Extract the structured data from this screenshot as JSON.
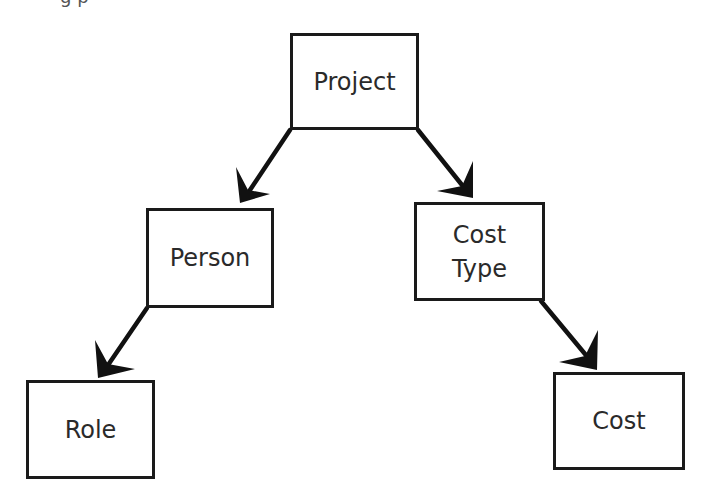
{
  "diagram": {
    "type": "hierarchy",
    "nodes": [
      {
        "id": "project",
        "label": "Project",
        "x": 290,
        "y": 33,
        "w": 129,
        "h": 97
      },
      {
        "id": "person",
        "label": "Person",
        "x": 146,
        "y": 208,
        "w": 128,
        "h": 100
      },
      {
        "id": "cost_type",
        "label": "Cost\nType",
        "x": 414,
        "y": 202,
        "w": 131,
        "h": 99
      },
      {
        "id": "role",
        "label": "Role",
        "x": 26,
        "y": 380,
        "w": 129,
        "h": 99
      },
      {
        "id": "cost",
        "label": "Cost",
        "x": 553,
        "y": 372,
        "w": 132,
        "h": 98
      }
    ],
    "edges": [
      {
        "from": "project",
        "to": "person"
      },
      {
        "from": "project",
        "to": "cost_type"
      },
      {
        "from": "person",
        "to": "role"
      },
      {
        "from": "cost_type",
        "to": "cost"
      }
    ],
    "colors": {
      "stroke": "#1a1a1a",
      "text": "#2a2a2a",
      "background": "#ffffff"
    }
  },
  "labels": {
    "project": "Project",
    "person": "Person",
    "cost_type_line1": "Cost",
    "cost_type_line2": "Type",
    "role": "Role",
    "cost": "Cost"
  }
}
